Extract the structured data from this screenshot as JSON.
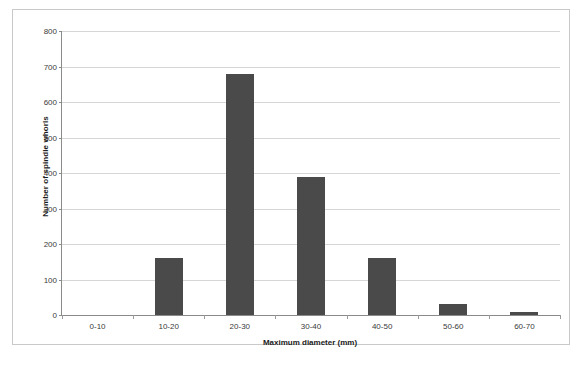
{
  "chart_data": {
    "type": "bar",
    "title": "",
    "xlabel": "Maximum diameter (mm)",
    "ylabel": "Number of spindle whorls",
    "categories": [
      "0-10",
      "10-20",
      "20-30",
      "30-40",
      "40-50",
      "50-60",
      "60-70"
    ],
    "values": [
      0,
      160,
      678,
      388,
      160,
      30,
      8
    ],
    "ylim": [
      0,
      800
    ],
    "ytick_labels": [
      "800",
      "700",
      "600",
      "500",
      "400",
      "300",
      "200",
      "100",
      "0"
    ],
    "ytick_values": [
      800,
      700,
      600,
      500,
      400,
      300,
      200,
      100,
      0
    ],
    "grid": "horizontal",
    "legend": "none",
    "bar_color": "#4a4a4a",
    "gridline_color": "#d6d6d6",
    "axis_color": "#8a8a8a",
    "background_color": "#ffffff"
  }
}
